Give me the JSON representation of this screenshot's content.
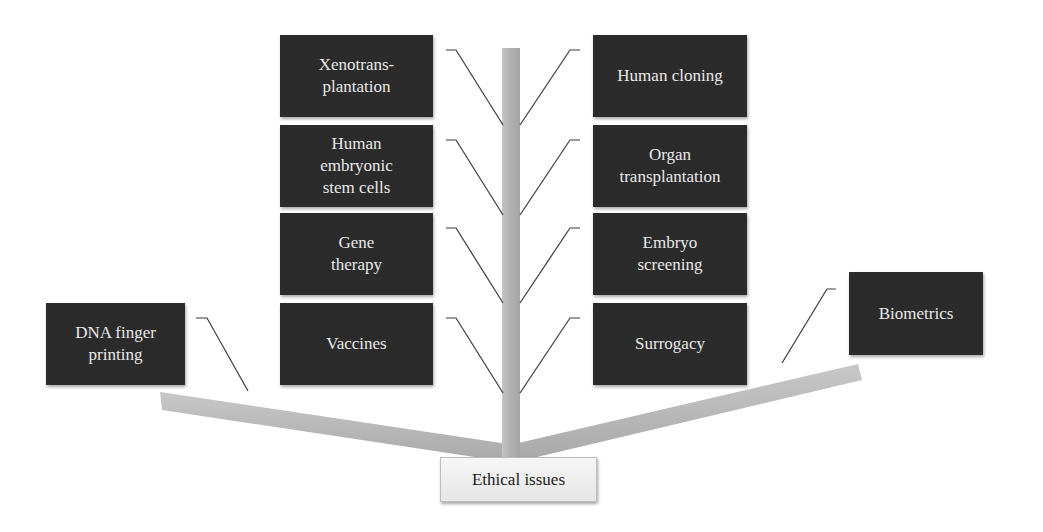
{
  "diagram": {
    "root": {
      "label": "Ethical issues"
    },
    "trunk_color": "#b5b5b5",
    "box_color": "#2b2b2b",
    "box_text_color": "#e8e8e8",
    "left_column": [
      {
        "label": "Xenotrans-\nplantation"
      },
      {
        "label": "Human\nembryonic\nstem cells"
      },
      {
        "label": "Gene\ntherapy"
      },
      {
        "label": "Vaccines"
      }
    ],
    "right_column": [
      {
        "label": "Human cloning"
      },
      {
        "label": "Organ\ntransplantation"
      },
      {
        "label": "Embryo\nscreening"
      },
      {
        "label": "Surrogacy"
      }
    ],
    "left_branch": {
      "label": "DNA finger\nprinting"
    },
    "right_branch": {
      "label": "Biometrics"
    }
  }
}
